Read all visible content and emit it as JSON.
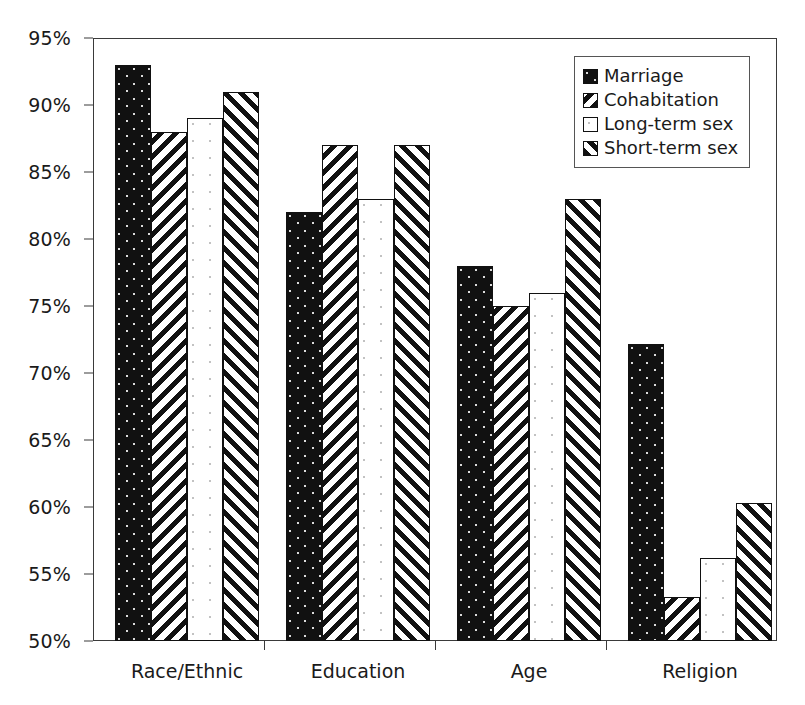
{
  "chart_data": {
    "type": "bar",
    "title": "",
    "subtitle": "",
    "xlabel": "",
    "ylabel": "",
    "categories": [
      "Race/Ethnic",
      "Education",
      "Age",
      "Religion"
    ],
    "series": [
      {
        "name": "Marriage",
        "values": [
          93.0,
          82.0,
          78.0,
          72.2
        ],
        "pattern": "solid-black-speckle"
      },
      {
        "name": "Cohabitation",
        "values": [
          88.0,
          87.0,
          75.0,
          53.3
        ],
        "pattern": "backslash-hatch"
      },
      {
        "name": "Long-term sex",
        "values": [
          89.0,
          83.0,
          76.0,
          56.2
        ],
        "pattern": "white-faint-dots"
      },
      {
        "name": "Short-term sex",
        "values": [
          91.0,
          87.0,
          83.0,
          60.3
        ],
        "pattern": "forwardslash-hatch"
      }
    ],
    "ylim": [
      50,
      95
    ],
    "ytick_step": 5,
    "ytick_labels": [
      "50%",
      "55%",
      "60%",
      "65%",
      "70%",
      "75%",
      "80%",
      "85%",
      "90%",
      "95%"
    ],
    "ytick_values": [
      50,
      55,
      60,
      65,
      70,
      75,
      80,
      85,
      90,
      95
    ],
    "grid": false,
    "legend_position": "top-right",
    "value_suffix": "%",
    "axis_color": "#3a3a3a",
    "bar_edge_color": "#111111",
    "background_color": "#ffffff"
  },
  "legend": {
    "entries": [
      {
        "label": "Marriage"
      },
      {
        "label": "Cohabitation"
      },
      {
        "label": "Long-term sex"
      },
      {
        "label": "Short-term sex"
      }
    ]
  }
}
